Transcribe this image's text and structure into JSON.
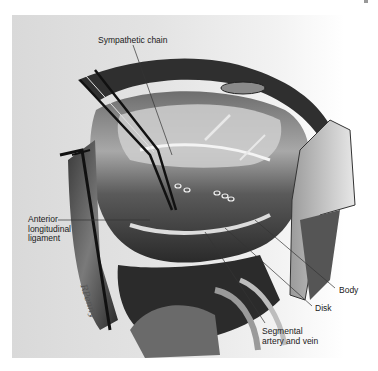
{
  "figure": {
    "type": "surgical anatomical illustration",
    "colors": {
      "background": "#ffffff",
      "panel": "#e0e0e0",
      "ink_dark": "#111111",
      "ink_mid": "#555555",
      "ink_light": "#bdbdbd",
      "label_text": "#1a1a1a"
    },
    "labels": {
      "sympathetic_chain": "Sympathetic chain",
      "anterior_line1": "Anterior",
      "anterior_line2": "longitudinal",
      "anterior_line3": "ligament",
      "body": "Body",
      "disk": "Disk",
      "segmental_line1": "Segmental",
      "segmental_line2": "artery and vein"
    },
    "artist_signature": "RPenny"
  }
}
